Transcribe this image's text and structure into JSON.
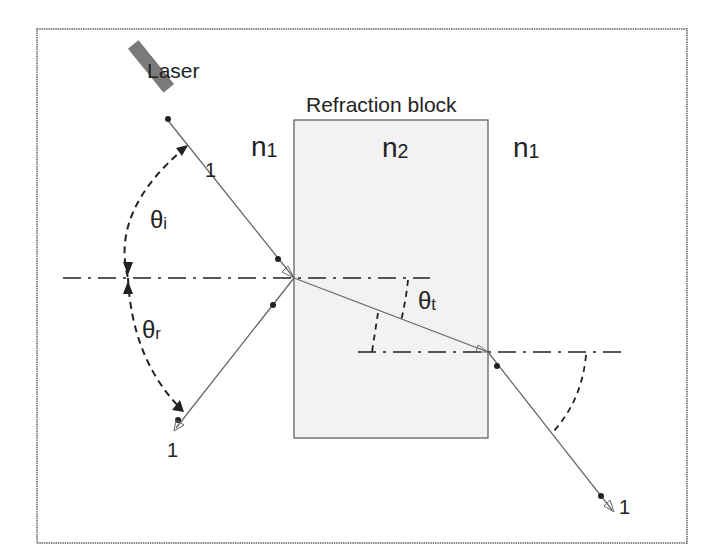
{
  "diagram": {
    "labels": {
      "laser": "Laser",
      "block": "Refraction block",
      "n1_left": {
        "base": "n",
        "sub": "1"
      },
      "n2": {
        "base": "n",
        "sub": "2"
      },
      "n1_right": {
        "base": "n",
        "sub": "1"
      },
      "theta_i": {
        "base": "θ",
        "sub": "i"
      },
      "theta_r": {
        "base": "θ",
        "sub": "r"
      },
      "theta_t": {
        "base": "θ",
        "sub": "t"
      },
      "ray_incident": "1",
      "ray_reflected": "1",
      "ray_exit": "1"
    },
    "colors": {
      "border": "#8a8a8a",
      "block_fill": "#f2f2f2",
      "block_stroke": "#555555",
      "ray": "#666666",
      "normal": "#222222",
      "laser": "#777777"
    }
  }
}
